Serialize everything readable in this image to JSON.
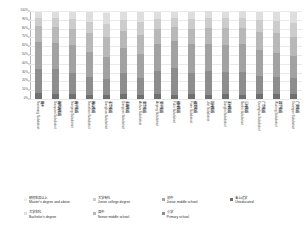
{
  "chart_data": {
    "type": "bar",
    "title": "",
    "xlabel": "",
    "ylabel": "",
    "stacked": true,
    "normalized_percent": true,
    "ylim": [
      0,
      100
    ],
    "grid": true,
    "legend_position": "bottom",
    "ytick_labels": [
      "100%",
      "90%",
      "80%",
      "70%",
      "60%",
      "50%",
      "40%",
      "30%",
      "20%",
      "10%",
      "0%"
    ],
    "ytick_values": [
      100,
      90,
      80,
      70,
      60,
      50,
      40,
      30,
      20,
      10,
      0
    ],
    "categories": [
      "南乡 Nanxiang Subdistrict",
      "南院南街道 Nanyuan Subdistrict",
      "南平街道 Nanping Subdistrict",
      "南山街道 Nanshan Subdistrict",
      "东华街道 Donghua Subdistrict",
      "东南街道 Dongnan Subdistrict",
      "安华街道 Anhua Subdistrict",
      "安平街道 Anping Subdistrict",
      "福林街道 Fulin Subdistrict",
      "福安街道 Fuan Subdistrict",
      "吉林街道 Jilin Subdistrict",
      "东林街道 Donglin Subdistrict",
      "三林街道 Sanlin Subdistrict",
      "广华街道 Guanghua Subdistrict",
      "武宁街道 Wuning Subdistrict",
      "广安街道 Guangan Subdistrict"
    ],
    "series": [
      {
        "name": "Uneducated",
        "name_cn": "未上过学",
        "color": "#6f6f6f",
        "values": [
          6.5,
          5.5,
          6.0,
          4.5,
          5.0,
          5.5,
          4.0,
          6.0,
          5.0,
          6.0,
          5.0,
          5.5,
          5.0,
          5.5,
          5.5,
          6.0
        ]
      },
      {
        "name": "Primary school",
        "name_cn": "小学",
        "color": "#8d8d8d",
        "values": [
          27.0,
          28.0,
          24.0,
          21.0,
          18.0,
          24.0,
          20.0,
          26.0,
          30.0,
          24.0,
          27.0,
          25.0,
          26.0,
          21.0,
          20.0,
          18.0
        ]
      },
      {
        "name": "Junior middle school",
        "name_cn": "初中",
        "color": "#a2a2a2",
        "values": [
          31.0,
          30.0,
          31.0,
          28.0,
          25.0,
          28.0,
          27.0,
          30.0,
          31.0,
          32.0,
          30.0,
          31.0,
          31.0,
          29.0,
          27.0,
          25.0
        ]
      },
      {
        "name": "Senior middle school",
        "name_cn": "高中",
        "color": "#b8b8b8",
        "values": [
          18.0,
          18.0,
          19.0,
          21.0,
          22.0,
          19.0,
          22.0,
          18.0,
          16.0,
          18.0,
          19.0,
          19.0,
          19.0,
          21.0,
          22.0,
          22.0
        ]
      },
      {
        "name": "Junior college degree",
        "name_cn": "大学专科",
        "color": "#cccccc",
        "values": [
          9.5,
          10.0,
          11.0,
          13.5,
          15.0,
          12.5,
          14.5,
          11.0,
          10.0,
          11.0,
          11.0,
          11.0,
          11.0,
          13.0,
          14.0,
          15.0
        ]
      },
      {
        "name": "Bachelor's degree",
        "name_cn": "大学本科",
        "color": "#dedede",
        "values": [
          6.5,
          7.0,
          8.0,
          10.5,
          13.0,
          9.5,
          11.0,
          8.0,
          7.0,
          8.0,
          7.5,
          7.5,
          7.5,
          9.5,
          10.5,
          12.5
        ]
      },
      {
        "name": "Master's degree and above",
        "name_cn": "研究生及以上",
        "color": "#efefef",
        "values": [
          1.5,
          1.5,
          1.0,
          1.5,
          2.0,
          1.0,
          1.5,
          1.0,
          1.0,
          1.0,
          0.5,
          1.0,
          0.5,
          1.0,
          1.0,
          1.5
        ]
      }
    ],
    "legend": [
      {
        "cn": "研究生及以上",
        "en": "Master's degree and above",
        "color": "#efefef"
      },
      {
        "cn": "大学专科",
        "en": "Junior college degree",
        "color": "#cccccc"
      },
      {
        "cn": "初中",
        "en": "Junior middle school",
        "color": "#a2a2a2"
      },
      {
        "cn": "未上过学",
        "en": "Uneducated",
        "color": "#6f6f6f"
      },
      {
        "cn": "大学本科",
        "en": "Bachelor's degree",
        "color": "#dedede"
      },
      {
        "cn": "高中",
        "en": "Senior middle school",
        "color": "#b8b8b8"
      },
      {
        "cn": "小学",
        "en": "Primary school",
        "color": "#8d8d8d"
      }
    ]
  }
}
